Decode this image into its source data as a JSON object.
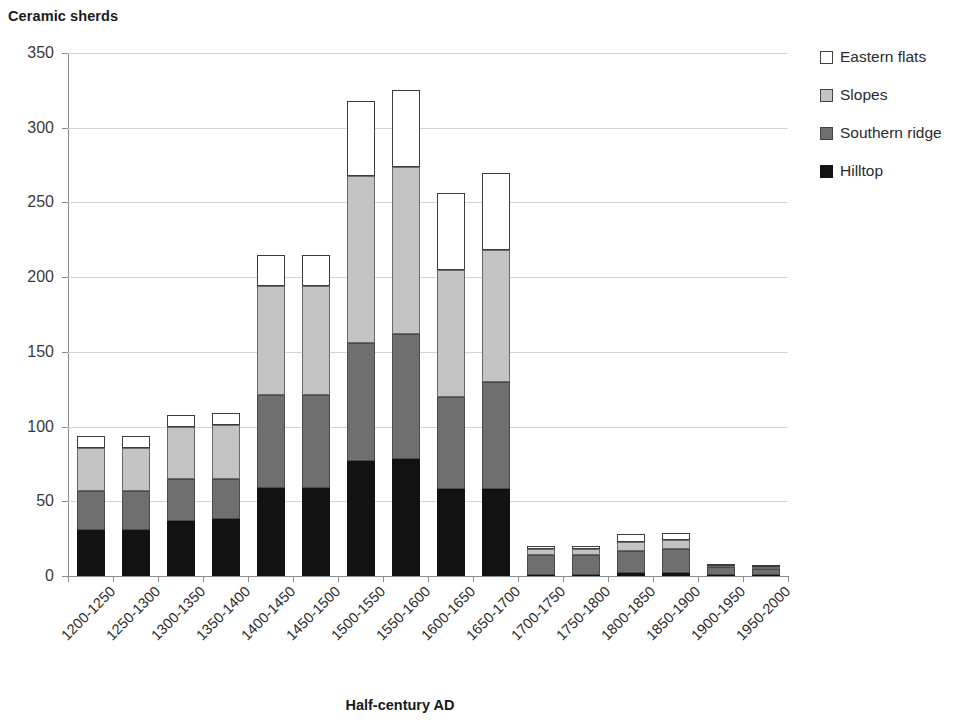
{
  "chart_data": {
    "type": "bar",
    "subtype": "stacked-vertical",
    "title": "Ceramic sherds",
    "xlabel": "Half-century AD",
    "ylabel": "",
    "ylim": [
      0,
      350
    ],
    "ytick_step": 50,
    "yticks": [
      "0",
      "50",
      "100",
      "150",
      "200",
      "250",
      "300",
      "350"
    ],
    "grid": "horizontal",
    "legend_position": "right",
    "categories": [
      "1200-1250",
      "1250-1300",
      "1300-1350",
      "1350-1400",
      "1400-1450",
      "1450-1500",
      "1500-1550",
      "1550-1600",
      "1600-1650",
      "1650-1700",
      "1700-1750",
      "1750-1800",
      "1800-1850",
      "1850-1900",
      "1900-1950",
      "1950-2000"
    ],
    "series": [
      {
        "name": "Hilltop",
        "color": "#121212",
        "values": [
          31,
          31,
          37,
          38,
          59,
          59,
          77,
          78,
          58,
          58,
          1,
          1,
          2,
          2,
          1,
          1
        ]
      },
      {
        "name": "Southern ridge",
        "color": "#6f6f6f",
        "values": [
          26,
          26,
          28,
          27,
          62,
          62,
          79,
          84,
          62,
          72,
          13,
          13,
          15,
          16,
          5,
          4
        ]
      },
      {
        "name": "Slopes",
        "color": "#c3c3c3",
        "values": [
          29,
          29,
          35,
          36,
          73,
          73,
          112,
          112,
          85,
          88,
          4,
          4,
          6,
          6,
          1,
          1
        ]
      },
      {
        "name": "Eastern flats",
        "color": "#ffffff",
        "values": [
          8,
          8,
          8,
          8,
          21,
          21,
          50,
          51,
          51,
          52,
          2,
          2,
          5,
          5,
          1,
          1
        ]
      }
    ],
    "totals": [
      94,
      94,
      108,
      109,
      215,
      215,
      318,
      325,
      256,
      270,
      20,
      20,
      28,
      29,
      8,
      7
    ]
  }
}
